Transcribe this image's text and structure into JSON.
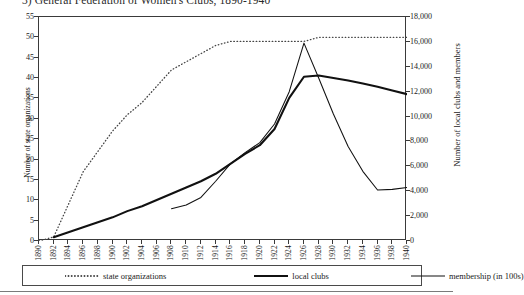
{
  "chart_data": {
    "type": "line",
    "title": "3) General Federation of Women's Clubs, 1890-1940",
    "xlabel": "",
    "grid": false,
    "legend_position": "bottom",
    "x": [
      1890,
      1892,
      1894,
      1896,
      1898,
      1900,
      1902,
      1904,
      1906,
      1908,
      1910,
      1912,
      1914,
      1916,
      1918,
      1920,
      1922,
      1924,
      1926,
      1928,
      1930,
      1932,
      1934,
      1936,
      1938,
      1940
    ],
    "xlim": [
      1890,
      1940
    ],
    "xtick_labels": [
      "1890",
      "1892",
      "1894",
      "1896",
      "1898",
      "1900",
      "1902",
      "1904",
      "1906",
      "1908",
      "1910",
      "1912",
      "1914",
      "1916",
      "1918",
      "1920",
      "1922",
      "1924",
      "1926",
      "1928",
      "1930",
      "1932",
      "1934",
      "1936",
      "1938",
      "1940"
    ],
    "axes": {
      "left": {
        "label": "Number of state organizations",
        "lim": [
          0,
          55
        ],
        "ticks": [
          0,
          5,
          10,
          15,
          20,
          25,
          30,
          35,
          40,
          45,
          50,
          55
        ],
        "tick_labels": [
          "0",
          "5",
          "10",
          "15",
          "20",
          "25",
          "30",
          "35",
          "40",
          "45",
          "50",
          "55"
        ]
      },
      "right": {
        "label": "Number of local clubs and members",
        "lim": [
          0,
          18000
        ],
        "ticks": [
          0,
          2000,
          4000,
          6000,
          8000,
          10000,
          12000,
          14000,
          16000,
          18000
        ],
        "tick_labels": [
          "0",
          "2,000",
          "4,000",
          "6,000",
          "8,000",
          "10,000",
          "12,000",
          "14,000",
          "16,000",
          "18,000"
        ]
      }
    },
    "series": [
      {
        "name": "state organizations",
        "axis": "left",
        "style": "dotted",
        "color": "#444444",
        "x": [
          1890,
          1892,
          1894,
          1896,
          1898,
          1900,
          1902,
          1904,
          1906,
          1908,
          1910,
          1912,
          1914,
          1916,
          1918,
          1920,
          1922,
          1924,
          1926,
          1928,
          1930,
          1932,
          1934,
          1936,
          1938,
          1940
        ],
        "values": [
          0,
          1,
          9,
          17,
          22,
          27,
          31,
          34,
          38,
          42,
          44,
          46,
          48,
          49,
          49,
          49,
          49,
          49,
          49,
          50,
          50,
          50,
          50,
          50,
          50,
          50
        ]
      },
      {
        "name": "local clubs",
        "axis": "right",
        "style": "thick-solid",
        "color": "#111111",
        "x": [
          1892,
          1894,
          1896,
          1898,
          1900,
          1902,
          1904,
          1906,
          1908,
          1910,
          1912,
          1914,
          1916,
          1918,
          1920,
          1922,
          1924,
          1926,
          1928,
          1930,
          1932,
          1934,
          1936,
          1938,
          1940
        ],
        "values": [
          300,
          700,
          1100,
          1500,
          1900,
          2400,
          2800,
          3300,
          3800,
          4300,
          4800,
          5400,
          6200,
          7000,
          7700,
          9000,
          11500,
          13200,
          13300,
          13100,
          12900,
          12650,
          12400,
          12100,
          11800
        ]
      },
      {
        "name": "membership (in 100s)",
        "axis": "right",
        "style": "thin-solid",
        "color": "#111111",
        "x": [
          1908,
          1910,
          1912,
          1914,
          1916,
          1918,
          1920,
          1922,
          1924,
          1926,
          1928,
          1930,
          1932,
          1934,
          1936,
          1938,
          1940
        ],
        "values": [
          2600,
          2900,
          3500,
          4800,
          6200,
          7100,
          7900,
          9400,
          12000,
          15900,
          13100,
          10200,
          7600,
          5600,
          4100,
          4150,
          4300
        ]
      }
    ]
  },
  "legend": {
    "items": [
      {
        "label": "state organizations",
        "style": "dotted"
      },
      {
        "label": "local clubs",
        "style": "thick-solid"
      },
      {
        "label": "membership (in 100s)",
        "style": "thin-solid"
      }
    ]
  }
}
